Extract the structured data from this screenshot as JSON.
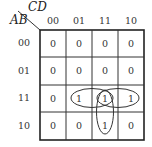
{
  "diagram": {
    "type": "karnaugh-map",
    "col_variables": "CD",
    "row_variables": "AB",
    "col_headers": [
      "00",
      "01",
      "11",
      "10"
    ],
    "row_headers": [
      "00",
      "01",
      "11",
      "10"
    ],
    "cells": [
      [
        "0",
        "0",
        "0",
        "0"
      ],
      [
        "0",
        "0",
        "0",
        "0"
      ],
      [
        "0",
        "1",
        "1",
        "1"
      ],
      [
        "0",
        "0",
        "1",
        "0"
      ]
    ],
    "groupings": [
      {
        "name": "row-11-cols-01-11",
        "cells": [
          [
            2,
            1
          ],
          [
            2,
            2
          ]
        ]
      },
      {
        "name": "row-11-cols-11-10",
        "cells": [
          [
            2,
            2
          ],
          [
            2,
            3
          ]
        ]
      },
      {
        "name": "col-11-rows-11-10",
        "cells": [
          [
            2,
            2
          ],
          [
            3,
            2
          ]
        ]
      }
    ]
  }
}
